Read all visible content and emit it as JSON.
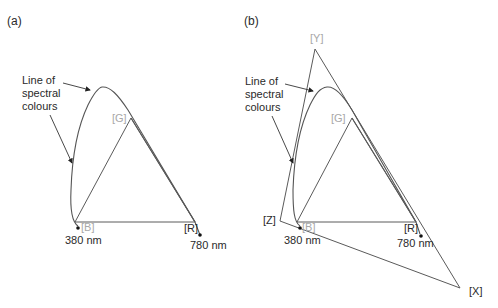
{
  "panels": [
    {
      "id": "a",
      "label": "(a)",
      "annotation": [
        "Line of",
        "spectral",
        "colours"
      ],
      "primaries": {
        "B": "[B]",
        "G": "[G]",
        "R": "[R]"
      },
      "wavelength_ends": {
        "start": "380 nm",
        "end": "780 nm"
      }
    },
    {
      "id": "b",
      "label": "(b)",
      "annotation": [
        "Line of",
        "spectral",
        "colours"
      ],
      "primaries": {
        "B": "[B]",
        "G": "[G]",
        "R": "[R]"
      },
      "imaginary_primaries": {
        "X": "[X]",
        "Y": "[Y]",
        "Z": "[Z]"
      },
      "wavelength_ends": {
        "start": "380 nm",
        "end": "780 nm"
      }
    }
  ],
  "colors": {
    "line": "#555555",
    "text": "#2a2a2a",
    "primary_label": "#a8a8a8"
  }
}
